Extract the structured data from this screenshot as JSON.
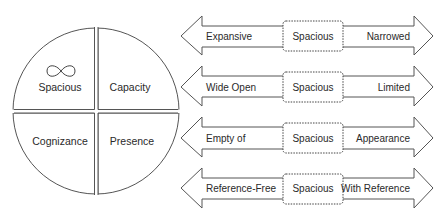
{
  "quadrant_diagram": {
    "quadrants": [
      {
        "label": "Spacious",
        "icon": "infinity-icon"
      },
      {
        "label": "Capacity"
      },
      {
        "label": "Cognizance"
      },
      {
        "label": "Presence"
      }
    ]
  },
  "spectra": [
    {
      "left": "Expansive",
      "center": "Spacious",
      "right": "Narrowed"
    },
    {
      "left": "Wide Open",
      "center": "Spacious",
      "right": "Limited"
    },
    {
      "left": "Empty of",
      "center": "Spacious",
      "right": "Appearance"
    },
    {
      "left": "Reference-Free",
      "center": "Spacious",
      "right": "With Reference"
    }
  ],
  "colors": {
    "stroke": "#555555",
    "text": "#2a2a2a",
    "background": "#ffffff"
  }
}
